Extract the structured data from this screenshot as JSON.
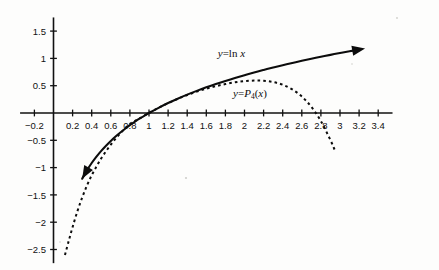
{
  "figure": {
    "background_color": "#fdfdfc",
    "ink_color": "#111111"
  },
  "chart_data": {
    "type": "line",
    "title": "",
    "subtitle": "",
    "xlabel": "",
    "ylabel": "",
    "grid": false,
    "legend_position": "inline-annotation",
    "xlim": [
      -0.35,
      3.55
    ],
    "ylim": [
      -2.75,
      1.75
    ],
    "x_ticks": [
      0.2,
      0.4,
      0.6,
      0.8,
      1,
      1.2,
      1.4,
      1.6,
      1.8,
      2,
      2.2,
      2.4,
      2.6,
      2.8,
      3,
      3.2,
      3.4
    ],
    "x_tick_labels": [
      "0.2",
      "0.4",
      "0.6",
      "0.8",
      "1",
      "1.2",
      "1.4",
      "1.6",
      "1.8",
      "2",
      "2.2",
      "2.4",
      "2.6",
      "2.8",
      "3",
      "3.2",
      "3.4"
    ],
    "x_negative_tick": -0.2,
    "x_negative_tick_label": "−0.2",
    "y_ticks": [
      1.5,
      1,
      0.5,
      -0.5,
      -1,
      -1.5,
      -2,
      -2.5
    ],
    "y_tick_labels": [
      "1.5",
      "1",
      "0.5",
      "−0.5",
      "−1",
      "−1.5",
      "−2",
      "−2.5"
    ],
    "annotations": [
      {
        "name": "ln-curve-label",
        "text": "y=ln x",
        "x": 1.72,
        "y": 1.02
      },
      {
        "name": "taylor-curve-label",
        "text": "y=P₄(x)",
        "x": 1.88,
        "y": 0.3
      }
    ],
    "series": [
      {
        "name": "y = ln x",
        "label": "y=ln x",
        "style": "solid",
        "arrow_start": true,
        "arrow_end": true,
        "x": [
          0.3,
          0.35,
          0.4,
          0.45,
          0.5,
          0.55,
          0.6,
          0.65,
          0.7,
          0.75,
          0.8,
          0.85,
          0.9,
          0.95,
          1.0,
          1.1,
          1.2,
          1.3,
          1.4,
          1.5,
          1.6,
          1.7,
          1.8,
          1.9,
          2.0,
          2.1,
          2.2,
          2.3,
          2.4,
          2.5,
          2.6,
          2.7,
          2.8,
          2.9,
          3.0,
          3.1,
          3.2
        ],
        "y": [
          -1.204,
          -1.05,
          -0.916,
          -0.799,
          -0.693,
          -0.598,
          -0.511,
          -0.431,
          -0.357,
          -0.288,
          -0.223,
          -0.163,
          -0.105,
          -0.051,
          0.0,
          0.095,
          0.182,
          0.262,
          0.336,
          0.405,
          0.47,
          0.531,
          0.588,
          0.642,
          0.693,
          0.742,
          0.788,
          0.833,
          0.875,
          0.916,
          0.956,
          0.993,
          1.03,
          1.065,
          1.099,
          1.131,
          1.163
        ]
      },
      {
        "name": "y = P4(x)",
        "label": "y=P₄(x)",
        "style": "dashed",
        "arrow_start": false,
        "arrow_end": false,
        "description": "fourth-degree Taylor polynomial of ln x about x = 1",
        "x": [
          0.12,
          0.16,
          0.2,
          0.25,
          0.3,
          0.35,
          0.4,
          0.45,
          0.5,
          0.55,
          0.6,
          0.65,
          0.7,
          0.75,
          0.8,
          0.85,
          0.9,
          0.95,
          1.0,
          1.1,
          1.2,
          1.3,
          1.4,
          1.5,
          1.6,
          1.7,
          1.8,
          1.9,
          2.0,
          2.1,
          2.2,
          2.3,
          2.4,
          2.5,
          2.6,
          2.7,
          2.8,
          2.9,
          2.95
        ],
        "y": [
          -2.6,
          -2.34,
          -2.09,
          -1.8,
          -1.55,
          -1.33,
          -1.14,
          -0.98,
          -0.83,
          -0.7,
          -0.58,
          -0.47,
          -0.37,
          -0.28,
          -0.2,
          -0.15,
          -0.1,
          -0.05,
          0.0,
          0.095,
          0.181,
          0.259,
          0.329,
          0.391,
          0.445,
          0.491,
          0.53,
          0.562,
          0.583,
          0.594,
          0.59,
          0.567,
          0.517,
          0.432,
          0.302,
          0.112,
          -0.148,
          -0.497,
          -0.7
        ]
      }
    ]
  }
}
